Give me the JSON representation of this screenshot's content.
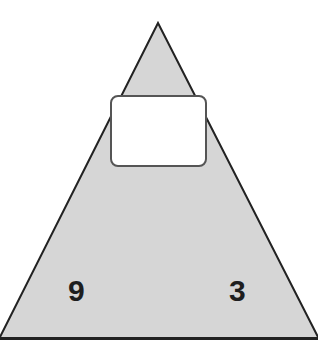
{
  "diagram": {
    "type": "number-triangle",
    "fill_color": "#d6d6d6",
    "stroke_color": "#222222",
    "top_box": {
      "value": ""
    },
    "bottom_left": {
      "value": "9"
    },
    "bottom_right": {
      "value": "3"
    }
  }
}
